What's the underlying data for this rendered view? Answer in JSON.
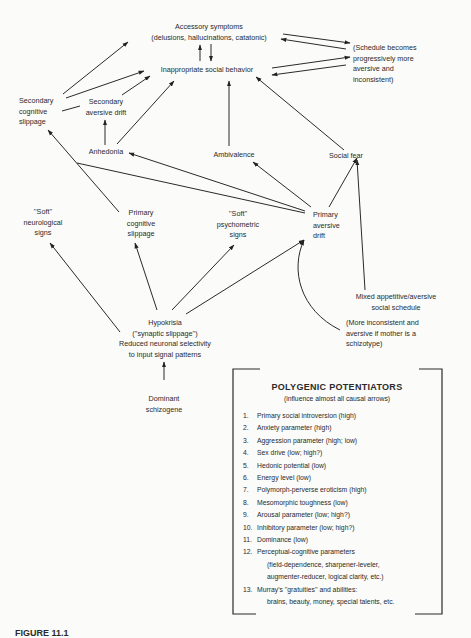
{
  "nodes": {
    "accessory": {
      "line1": "Accessory symptoms",
      "line2": "(delusions, hallucinations, catatonic)"
    },
    "inappropriate": {
      "line1": "Inappropriate social behavior"
    },
    "schedule_becomes": {
      "line1": "(Schedule becomes",
      "line2": "progressively more",
      "line3": "aversive and",
      "line4": "inconsistent)"
    },
    "secondary_cognitive": {
      "line1": "Secondary",
      "line2": "cognitive",
      "line3": "slippage"
    },
    "secondary_aversive": {
      "line1": "Secondary",
      "line2": "aversive drift"
    },
    "anhedonia": {
      "line1": "Anhedonia"
    },
    "ambivalence": {
      "line1": "Ambivalence"
    },
    "social_fear": {
      "line1": "Social fear"
    },
    "soft_neuro": {
      "line1": "''Soft''",
      "line2": "neurological",
      "line3": "signs"
    },
    "primary_cognitive": {
      "line1": "Primary",
      "line2": "cognitive",
      "line3": "slippage"
    },
    "soft_psych": {
      "line1": "''Soft''",
      "line2": "psychometric",
      "line3": "signs"
    },
    "primary_aversive": {
      "line1": "Primary",
      "line2": "aversive",
      "line3": "drift"
    },
    "mixed_schedule": {
      "line1": "Mixed appetitive/aversive",
      "line2": "social schedule",
      "line3": "(More inconsistent and",
      "line4": "aversive if mother is a",
      "line5": "schizotype)"
    },
    "hypokrisia": {
      "line1": "Hypokrisia",
      "line2": "(''synaptic slippage'')",
      "line3": "Reduced neuronal selectivity",
      "line4": "to input signal patterns"
    },
    "dominant": {
      "line1": "Dominant",
      "line2": "schizogene"
    }
  },
  "potentiators": {
    "title": "POLYGENIC POTENTIATORS",
    "subtitle": "(influence almost all causal arrows)",
    "items": [
      {
        "num": "1.",
        "text": "Primary social introversion (high)"
      },
      {
        "num": "2.",
        "text": "Anxiety parameter (high)"
      },
      {
        "num": "3.",
        "text": "Aggression parameter (high; low)"
      },
      {
        "num": "4.",
        "text": "Sex drive (low; high?)"
      },
      {
        "num": "5.",
        "text": "Hedonic potential (low)"
      },
      {
        "num": "6.",
        "text": "Energy level (low)"
      },
      {
        "num": "7.",
        "text": "Polymorph-perverse eroticism (high)"
      },
      {
        "num": "8.",
        "text": "Mesomorphic toughness (low)"
      },
      {
        "num": "9.",
        "text": "Arousal parameter (low; high?)"
      },
      {
        "num": "10.",
        "text": "Inhibitory parameter (low; high?)"
      },
      {
        "num": "11.",
        "text": "Dominance (low)"
      },
      {
        "num": "12.",
        "text": "Perceptual-cognitive parameters",
        "cont1": "(field-dependence, sharpener-leveler,",
        "cont2": "augmenter-reducer, logical clarity, etc.)"
      },
      {
        "num": "13.",
        "text": "Murray's ''gratuities'' and abilities:",
        "cont1": "brains, beauty, money, special talents, etc."
      }
    ]
  },
  "caption": {
    "text": "FIGURE 11.1"
  }
}
